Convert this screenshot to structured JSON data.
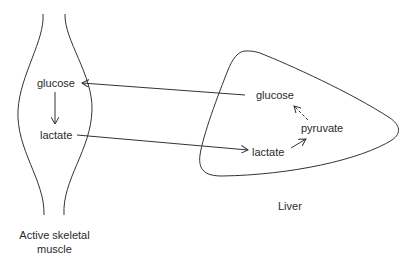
{
  "muscle": {
    "caption_line1": "Active skeletal",
    "caption_line2": "muscle",
    "glucose": "glucose",
    "lactate": "lactate"
  },
  "liver": {
    "caption": "Liver",
    "glucose": "glucose",
    "pyruvate": "pyruvate",
    "lactate": "lactate"
  },
  "colors": {
    "line": "#333333",
    "text": "#2a2a2a",
    "background": "#ffffff"
  }
}
